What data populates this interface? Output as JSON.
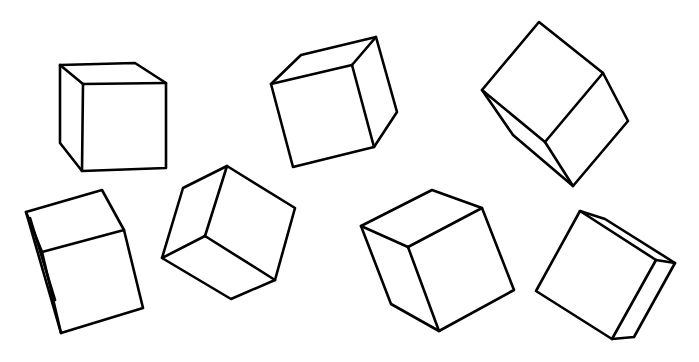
{
  "image": {
    "width": 699,
    "height": 362,
    "background": "#ffffff",
    "stroke_color": "#000000",
    "description": "Seven line-drawn cubes in various orientations"
  },
  "cubes": [
    {
      "name": "cube-1",
      "outline": [
        [
          60,
          65
        ],
        [
          135,
          63
        ],
        [
          166,
          83
        ],
        [
          166,
          168
        ],
        [
          82,
          171
        ],
        [
          60,
          143
        ]
      ],
      "edges": [
        [
          [
            60,
            65
          ],
          [
            83,
            84
          ]
        ],
        [
          [
            83,
            84
          ],
          [
            166,
            83
          ]
        ],
        [
          [
            83,
            84
          ],
          [
            82,
            171
          ]
        ]
      ]
    },
    {
      "name": "cube-2",
      "outline": [
        [
          271,
          84
        ],
        [
          301,
          55
        ],
        [
          376,
          37
        ],
        [
          397,
          112
        ],
        [
          374,
          147
        ],
        [
          293,
          167
        ]
      ],
      "edges": [
        [
          [
            271,
            84
          ],
          [
            352,
            65
          ]
        ],
        [
          [
            352,
            65
          ],
          [
            376,
            37
          ]
        ],
        [
          [
            352,
            65
          ],
          [
            374,
            147
          ]
        ]
      ]
    },
    {
      "name": "cube-3",
      "outline": [
        [
          539,
          22
        ],
        [
          603,
          73
        ],
        [
          628,
          121
        ],
        [
          573,
          186
        ],
        [
          513,
          135
        ],
        [
          482,
          90
        ]
      ],
      "edges": [
        [
          [
            482,
            90
          ],
          [
            545,
            142
          ]
        ],
        [
          [
            545,
            142
          ],
          [
            603,
            73
          ]
        ],
        [
          [
            545,
            142
          ],
          [
            573,
            186
          ]
        ]
      ]
    },
    {
      "name": "cube-4",
      "outline": [
        [
          26,
          212
        ],
        [
          102,
          190
        ],
        [
          124,
          230
        ],
        [
          143,
          308
        ],
        [
          61,
          333
        ],
        [
          26,
          212
        ]
      ],
      "edges": [
        [
          [
            26,
            212
          ],
          [
            42,
            252
          ]
        ],
        [
          [
            42,
            252
          ],
          [
            124,
            230
          ]
        ],
        [
          [
            42,
            252
          ],
          [
            61,
            333
          ]
        ],
        [
          [
            30,
            218
          ],
          [
            55,
            300
          ]
        ]
      ]
    },
    {
      "name": "cube-5",
      "outline": [
        [
          227,
          166
        ],
        [
          295,
          208
        ],
        [
          275,
          280
        ],
        [
          231,
          299
        ],
        [
          162,
          258
        ],
        [
          183,
          188
        ]
      ],
      "edges": [
        [
          [
            227,
            166
          ],
          [
            205,
            236
          ]
        ],
        [
          [
            205,
            236
          ],
          [
            162,
            258
          ]
        ],
        [
          [
            205,
            236
          ],
          [
            275,
            280
          ]
        ]
      ]
    },
    {
      "name": "cube-6",
      "outline": [
        [
          361,
          226
        ],
        [
          432,
          190
        ],
        [
          482,
          208
        ],
        [
          514,
          290
        ],
        [
          439,
          331
        ],
        [
          391,
          304
        ]
      ],
      "edges": [
        [
          [
            361,
            226
          ],
          [
            408,
            247
          ]
        ],
        [
          [
            408,
            247
          ],
          [
            482,
            208
          ]
        ],
        [
          [
            408,
            247
          ],
          [
            439,
            331
          ]
        ]
      ]
    },
    {
      "name": "cube-7",
      "outline": [
        [
          580,
          211
        ],
        [
          605,
          219
        ],
        [
          675,
          263
        ],
        [
          634,
          337
        ],
        [
          612,
          339
        ],
        [
          536,
          291
        ]
      ],
      "edges": [
        [
          [
            580,
            211
          ],
          [
            656,
            260
          ]
        ],
        [
          [
            656,
            260
          ],
          [
            675,
            263
          ]
        ],
        [
          [
            656,
            260
          ],
          [
            612,
            339
          ]
        ]
      ]
    }
  ]
}
